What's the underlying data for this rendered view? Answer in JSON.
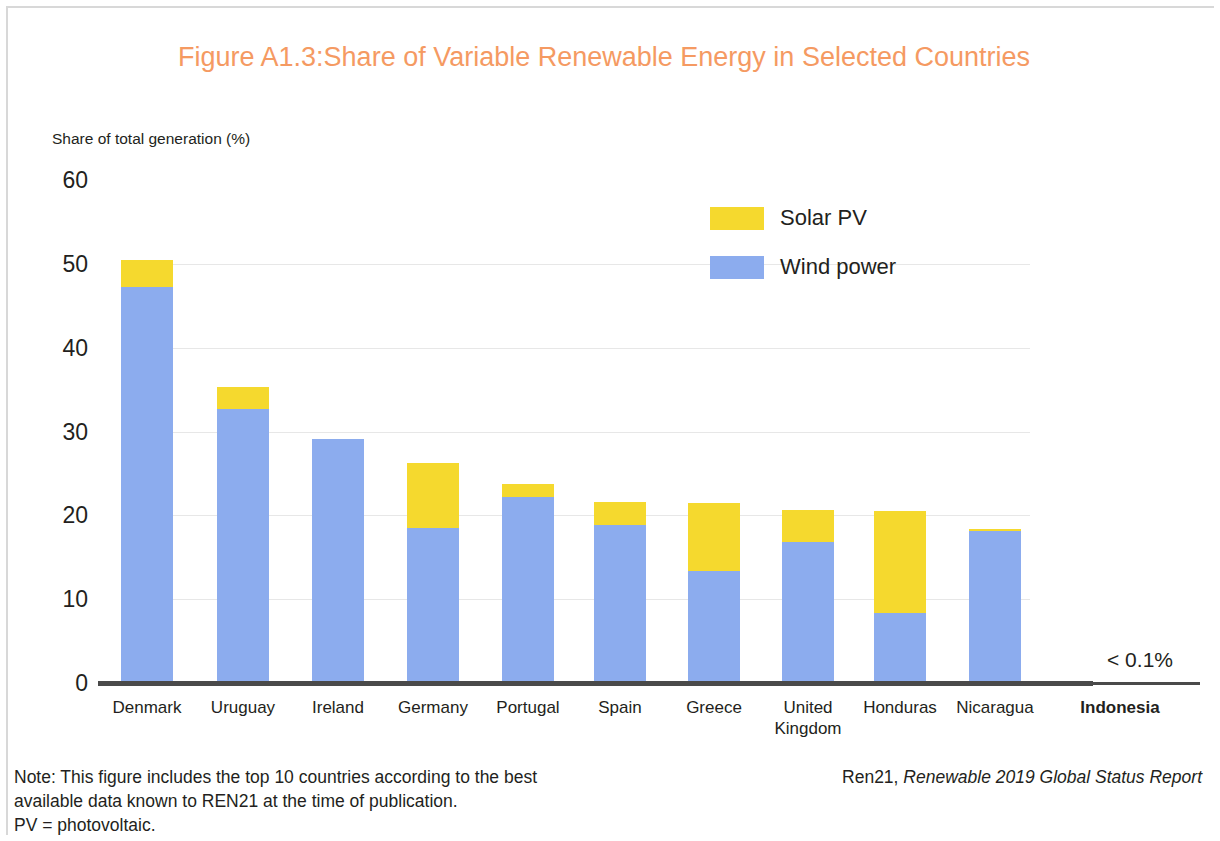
{
  "figure": {
    "number": "Figure A1.3:",
    "title": "Share of Variable Renewable Energy in Selected Countries",
    "title_color": "#f59a62"
  },
  "legend": {
    "position": "inside-top-right",
    "items": [
      {
        "label": "Solar PV",
        "color": "#f5d92e"
      },
      {
        "label": "Wind power",
        "color": "#8cacee"
      }
    ]
  },
  "axis": {
    "y_caption": "Share of total generation (%)",
    "y_ticks": [
      "0",
      "10",
      "20",
      "30",
      "40",
      "50",
      "60"
    ]
  },
  "annotation": {
    "indonesia_value": "< 0.1%"
  },
  "footer": {
    "note_line1": "Note: This figure includes the top 10 countries according to the best",
    "note_line2": "available data known to REN21 at the time of publication.",
    "note_line3": "PV = photovoltaic.",
    "source_prefix": "Ren21, ",
    "source_italic": "Renewable 2019 Global Status Report"
  },
  "chart_data": {
    "type": "bar",
    "title": "Share of Variable Renewable Energy in Selected Countries",
    "subtitle": "Figure A1.3:",
    "xlabel": "",
    "ylabel": "Share of total generation (%)",
    "ylim": [
      0,
      60
    ],
    "ytick_values": [
      0,
      10,
      20,
      30,
      40,
      50,
      60
    ],
    "grid": true,
    "stacked": true,
    "legend": [
      "Solar PV",
      "Wind power"
    ],
    "categories": [
      "Denmark",
      "Uruguay",
      "Ireland",
      "Germany",
      "Portugal",
      "Spain",
      "Greece",
      "United Kingdom",
      "Honduras",
      "Nicaragua",
      "Indonesia"
    ],
    "series": [
      {
        "name": "Wind power",
        "color": "#8cacee",
        "values": [
          47.2,
          32.7,
          29.1,
          18.5,
          22.2,
          18.9,
          13.3,
          16.8,
          8.4,
          18.1,
          0
        ]
      },
      {
        "name": "Solar PV",
        "color": "#f5d92e",
        "values": [
          3.3,
          2.6,
          0,
          7.7,
          1.5,
          2.7,
          8.2,
          3.8,
          12.1,
          0.3,
          0
        ]
      }
    ],
    "totals": [
      50.5,
      35.3,
      29.1,
      26.2,
      23.7,
      21.6,
      21.5,
      20.6,
      20.5,
      18.4,
      0
    ],
    "annotations": [
      {
        "category": "Indonesia",
        "text": "< 0.1%",
        "bold_label": true
      }
    ]
  },
  "geometry": {
    "baseline_y": 683,
    "px_per_unit": 8.383,
    "bar_width": 52,
    "bar_centers": [
      147,
      243,
      338,
      433,
      528,
      620,
      714,
      808,
      900,
      995
    ],
    "label_centers": [
      147,
      243,
      338,
      433,
      528,
      620,
      714,
      808,
      900,
      995,
      1120
    ]
  }
}
